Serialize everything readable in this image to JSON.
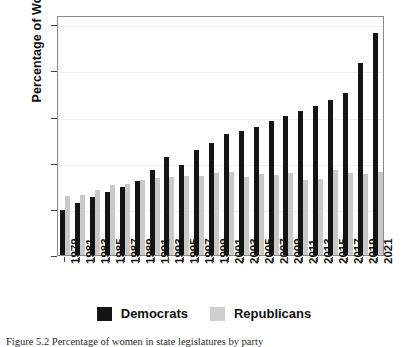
{
  "figure": {
    "caption": "Figure 5.2  Percentage of women in state legislatures by party"
  },
  "chart_data": {
    "type": "bar",
    "title": "",
    "xlabel": "",
    "ylabel": "Percentage of Women",
    "ylim": [
      0.0,
      0.52
    ],
    "yticks": [
      "0.0",
      "0.1",
      "0.2",
      "0.3",
      "0.4",
      "0.5"
    ],
    "ytick_values": [
      0.0,
      0.1,
      0.2,
      0.3,
      0.4,
      0.5
    ],
    "grid": true,
    "legend_position": "bottom",
    "categories": [
      "1979",
      "1981",
      "1983",
      "1985",
      "1987",
      "1989",
      "1991",
      "1993",
      "1995",
      "1997",
      "1999",
      "2001",
      "2003",
      "2005",
      "2007",
      "2009",
      "2011",
      "2013",
      "2015",
      "2017",
      "2019",
      "2021"
    ],
    "series": [
      {
        "name": "Democrats",
        "color": "#141414",
        "values": [
          0.098,
          0.112,
          0.126,
          0.136,
          0.148,
          0.161,
          0.184,
          0.212,
          0.196,
          0.228,
          0.242,
          0.263,
          0.268,
          0.277,
          0.29,
          0.302,
          0.313,
          0.323,
          0.335,
          0.35,
          0.415,
          0.48
        ]
      },
      {
        "name": "Republicans",
        "color": "#c9c9c9",
        "values": [
          0.128,
          0.131,
          0.141,
          0.152,
          0.153,
          0.163,
          0.167,
          0.17,
          0.171,
          0.172,
          0.178,
          0.179,
          0.17,
          0.175,
          0.173,
          0.178,
          0.163,
          0.164,
          0.184,
          0.177,
          0.175,
          0.18
        ]
      }
    ]
  },
  "legend": {
    "items": [
      {
        "label": "Democrats",
        "color": "#141414"
      },
      {
        "label": "Republicans",
        "color": "#cfcfcf"
      }
    ]
  }
}
